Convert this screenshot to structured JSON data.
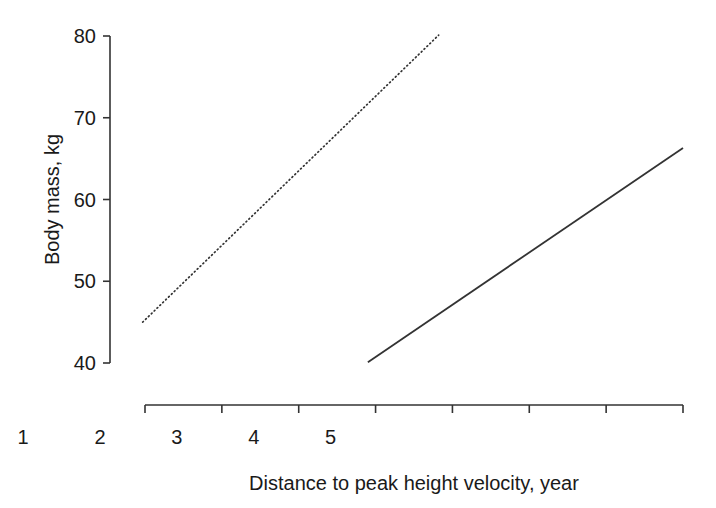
{
  "chart_data": {
    "type": "line",
    "title": "",
    "xlabel": "Distance to peak height velocity, year",
    "ylabel": "Body mass, kg",
    "xlim": [
      -2,
      5
    ],
    "ylim": [
      40,
      80
    ],
    "grid": false,
    "legend": "none",
    "xticks": [
      -2,
      -1,
      0,
      1,
      2,
      3,
      4,
      5
    ],
    "xtick_labels": [
      "-2",
      "-1",
      "PHV",
      "1",
      "2",
      "3",
      "4",
      "5"
    ],
    "yticks": [
      40,
      50,
      60,
      70,
      80
    ],
    "ytick_labels": [
      "40",
      "50",
      "60",
      "70",
      "80"
    ],
    "series": [
      {
        "name": "dotted-line",
        "style": "dotted",
        "color": "#333333",
        "x": [
          -2.03,
          1.82
        ],
        "y": [
          45.0,
          80.1
        ],
        "points": [
          [
            -2.03,
            45.0
          ],
          [
            1.82,
            80.1
          ]
        ]
      },
      {
        "name": "solid-line",
        "style": "solid",
        "color": "#333333",
        "x": [
          0.9,
          5.0
        ],
        "y": [
          40.1,
          66.3
        ],
        "points": [
          [
            0.9,
            40.1
          ],
          [
            5.0,
            66.3
          ]
        ]
      }
    ]
  },
  "axes": {
    "x_axis_name": "x-axis",
    "y_axis_name": "y-axis",
    "xtick_labels": [
      "-2",
      "-1",
      "PHV",
      "1",
      "2",
      "3",
      "4",
      "5"
    ],
    "ytick_labels": [
      "80",
      "70",
      "60",
      "50",
      "40"
    ],
    "x_title": "Distance to peak height velocity, year",
    "y_title": "Body mass, kg"
  },
  "style": {
    "axis_color": "#333333",
    "text_color": "#1a1a1a",
    "background": "#ffffff"
  }
}
